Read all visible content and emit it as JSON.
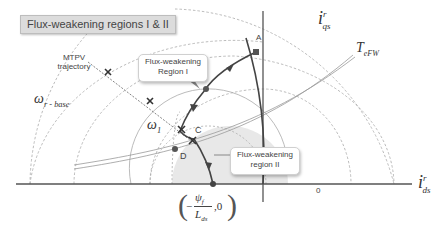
{
  "title": "Flux-weakening regions I & II",
  "callouts": {
    "region1_line1": "Flux-weakening",
    "region1_line2": "Region I",
    "region2_line1": "Flux-weakening",
    "region2_line2": "region II"
  },
  "labels": {
    "mtpv_line1": "MTPV",
    "mtpv_line2": "trajectory",
    "point_a": "A",
    "point_c": "C",
    "point_d": "D",
    "origin": "0",
    "omega_base_main": "ω",
    "omega_base_sub": "r - base",
    "omega1_main": "ω",
    "omega1_sub": "1",
    "iqs_main": "i",
    "iqs_sup": "r",
    "iqs_sub": "qs",
    "ids_main": "i",
    "ids_sup": "r",
    "ids_sub": "ds",
    "tefw_main": "T",
    "tefw_sub": "eFW",
    "point_coord_num": "ψ",
    "point_coord_num_sub": "f",
    "point_coord_den": "L",
    "point_coord_den_sub": "ds",
    "point_coord_minus": "−",
    "point_coord_zero": ",0"
  },
  "colors": {
    "axis": "#555555",
    "curve": "#444444",
    "dashed": "#aaaaaa",
    "shade": "#e6e6e6",
    "torque": "#999999"
  }
}
